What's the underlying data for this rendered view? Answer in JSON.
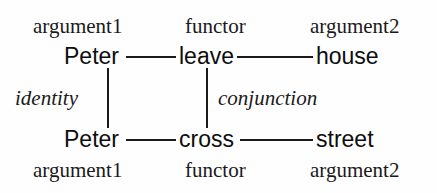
{
  "diagram": {
    "background_color": "#fefefe",
    "line_color": "#1a1a1a",
    "top_labels": {
      "argument1": "argument1",
      "functor": "functor",
      "argument2": "argument2"
    },
    "bottom_labels": {
      "argument1": "argument1",
      "functor": "functor",
      "argument2": "argument2"
    },
    "top_row": {
      "argument1": "Peter",
      "functor": "leave",
      "argument2": "house"
    },
    "bottom_row": {
      "argument1": "Peter",
      "functor": "cross",
      "argument2": "street"
    },
    "relations": {
      "left": "identity",
      "right": "conjunction"
    }
  }
}
